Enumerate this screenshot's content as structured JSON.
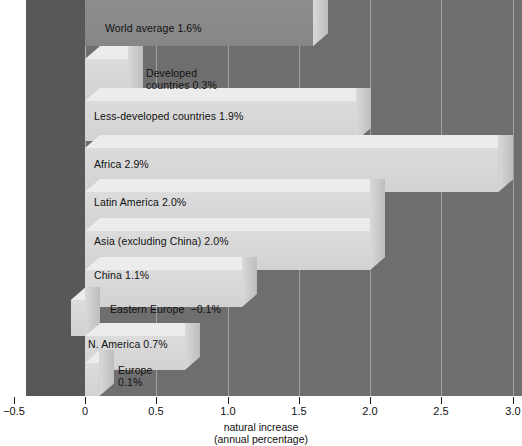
{
  "chart_data": {
    "type": "bar",
    "orientation": "horizontal",
    "title": "",
    "xlabel": "natural increase",
    "xlabel_sub": "(annual percentage)",
    "ylabel": "",
    "xlim": [
      -0.5,
      3.0
    ],
    "xticks": [
      "-0.5",
      "0",
      "0.5",
      "1.0",
      "1.5",
      "2.0",
      "2.5",
      "3.0"
    ],
    "xtick_values": [
      -0.5,
      0,
      0.5,
      1.0,
      1.5,
      2.0,
      2.5,
      3.0
    ],
    "grid": true,
    "legend": "none",
    "categories": [
      "World average",
      "Developed countries",
      "Less-developed countries",
      "Africa",
      "Latin America",
      "Asia (excluding China)",
      "China",
      "Eastern Europe",
      "N. America",
      "Europe"
    ],
    "values": [
      1.6,
      0.3,
      1.9,
      2.9,
      2.0,
      2.0,
      1.1,
      -0.1,
      0.7,
      0.1
    ],
    "bars": [
      {
        "label": "World average 1.6%",
        "category": "World average",
        "value": 1.6,
        "shade": "dim"
      },
      {
        "label": "Developed\ncountries 0.3%",
        "category": "Developed countries",
        "value": 0.3,
        "shade": "light"
      },
      {
        "label": "Less-developed countries 1.9%",
        "category": "Less-developed countries",
        "value": 1.9,
        "shade": "light"
      },
      {
        "label": "Africa 2.9%",
        "category": "Africa",
        "value": 2.9,
        "shade": "light"
      },
      {
        "label": "Latin America 2.0%",
        "category": "Latin America",
        "value": 2.0,
        "shade": "light"
      },
      {
        "label": "Asia (excluding China) 2.0%",
        "category": "Asia (excluding China)",
        "value": 2.0,
        "shade": "light"
      },
      {
        "label": "China 1.1%",
        "category": "China",
        "value": 1.1,
        "shade": "light"
      },
      {
        "label": "Eastern Europe  −0.1%",
        "category": "Eastern Europe",
        "value": -0.1,
        "shade": "light"
      },
      {
        "label": "N. America 0.7%",
        "category": "N. America",
        "value": 0.7,
        "shade": "light"
      },
      {
        "label": "Europe\n0.1%",
        "category": "Europe",
        "value": 0.1,
        "shade": "light"
      }
    ],
    "colors": {
      "plot_background": "#6e6e6e",
      "plot_background_negative": "#585858",
      "bar_front": "#d6d6d6",
      "bar_top": "#ececec",
      "bar_side": "#c4c4c4",
      "bar_front_dim": "#8a8a8a",
      "gridline": "#e1e1e1",
      "text": "#111111",
      "page_background": "#ffffff"
    }
  }
}
